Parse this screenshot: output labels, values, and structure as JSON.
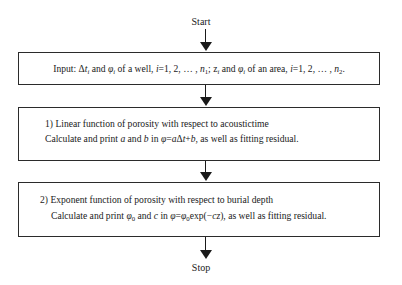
{
  "flowchart": {
    "start_label": "Start",
    "stop_label": "Stop",
    "steps": [
      {
        "id": "input",
        "lines": [
          "Input: Δt_i and φ_i of a well, i=1, 2, … , n_1; z_i and φ_i of an area, i=1, 2, … , n_2."
        ]
      },
      {
        "id": "linear",
        "lines": [
          "1) Linear function of porosity with respect to acoustictime",
          "Calculate and print a and b in φ=aΔt+b, as well as fitting residual."
        ]
      },
      {
        "id": "exponent",
        "lines": [
          "2) Exponent function of porosity with respect to burial depth",
          "Calculate and print φ_0 and c in φ=φ_0exp(−cz), as well as fitting residual."
        ]
      }
    ],
    "input_parts": {
      "p1": "Input: ",
      "delta": "Δ",
      "t": "t",
      "i": "i",
      "and1": " and ",
      "phi": "φ",
      "well": " of a well, ",
      "ieq": "=1, 2, … , ",
      "n": "n",
      "one": "1",
      "semi": "; z",
      "area": " of an area, ",
      "two": "2",
      "end": "."
    },
    "linear_parts": {
      "title": "1) Linear function of porosity with respect to acoustictime",
      "c1": "Calculate and print ",
      "a": "a",
      "and": " and ",
      "b": "b",
      "in": " in ",
      "phi": "φ",
      "eq": "=",
      "delta": "Δ",
      "t": "t",
      "plus": "+",
      "tail": ", as well as fitting residual."
    },
    "exponent_parts": {
      "title": "2) Exponent function of porosity with respect to burial depth",
      "c1": "Calculate and print ",
      "phi": "φ",
      "zero": "0",
      "and": " and ",
      "c": "c",
      "in": " in ",
      "eq": "=",
      "exp": "exp(−",
      "cz": "cz",
      "close": ")",
      "tail": ", as well as fitting residual."
    },
    "colors": {
      "line": "#1a1a1a",
      "border": "#2b2b2b",
      "background": "#ffffff"
    }
  }
}
